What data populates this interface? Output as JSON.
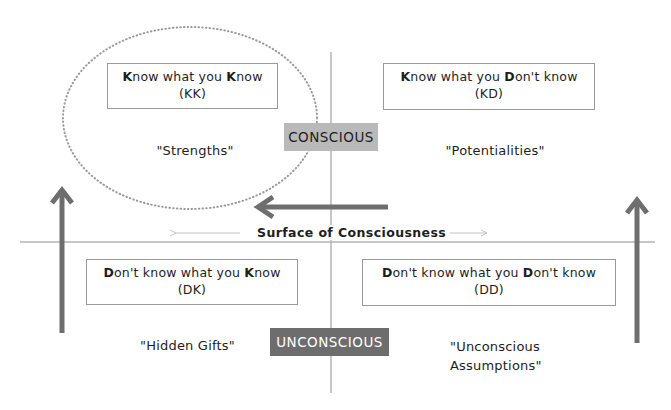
{
  "diagram": {
    "axis_labels": {
      "top": "CONSCIOUS",
      "bottom": "UNCONSCIOUS",
      "horizontal": "Surface of Consciousness"
    },
    "quadrants": [
      {
        "id": "KK",
        "position": "top-left",
        "title_parts": [
          {
            "text": "K",
            "bold": true
          },
          {
            "text": "now what you ",
            "bold": false
          },
          {
            "text": "K",
            "bold": true
          },
          {
            "text": "now",
            "bold": false
          }
        ],
        "title": "Know what you Know",
        "code": "(KK)",
        "label": "\"Strengths\"",
        "highlighted": true
      },
      {
        "id": "KD",
        "position": "top-right",
        "title_parts": [
          {
            "text": "K",
            "bold": true
          },
          {
            "text": "now what you ",
            "bold": false
          },
          {
            "text": "D",
            "bold": true
          },
          {
            "text": "on't know",
            "bold": false
          }
        ],
        "title": "Know what you Don't know",
        "code": "(KD)",
        "label": "\"Potentialities\""
      },
      {
        "id": "DK",
        "position": "bottom-left",
        "title_parts": [
          {
            "text": "D",
            "bold": true
          },
          {
            "text": "on't know what you ",
            "bold": false
          },
          {
            "text": "K",
            "bold": true
          },
          {
            "text": "now",
            "bold": false
          }
        ],
        "title": "Don't know what you Know",
        "code": "(DK)",
        "label": "\"Hidden Gifts\""
      },
      {
        "id": "DD",
        "position": "bottom-right",
        "title_parts": [
          {
            "text": "D",
            "bold": true
          },
          {
            "text": "on't know what you ",
            "bold": false
          },
          {
            "text": "D",
            "bold": true
          },
          {
            "text": "on't know",
            "bold": false
          }
        ],
        "title": "Don't know what you Don't know",
        "code": "(DD)",
        "label_lines": [
          "\"Unconscious",
          "Assumptions\""
        ]
      }
    ],
    "arrows": [
      {
        "name": "left-up-arrow",
        "direction": "up",
        "from": "DK",
        "to": "KK"
      },
      {
        "name": "right-up-arrow",
        "direction": "up",
        "from": "DD",
        "to": "KD"
      },
      {
        "name": "horizontal-arrow",
        "direction": "left",
        "from": "KD",
        "to": "KK"
      }
    ],
    "colors": {
      "arrow": "#6e6e6e",
      "divider": "#b5b5b5",
      "box_border": "#9a9a9a",
      "conscious_badge": "#b9b9b9",
      "unconscious_badge": "#6d6d6d",
      "ellipse": "#9a9a9a"
    }
  }
}
